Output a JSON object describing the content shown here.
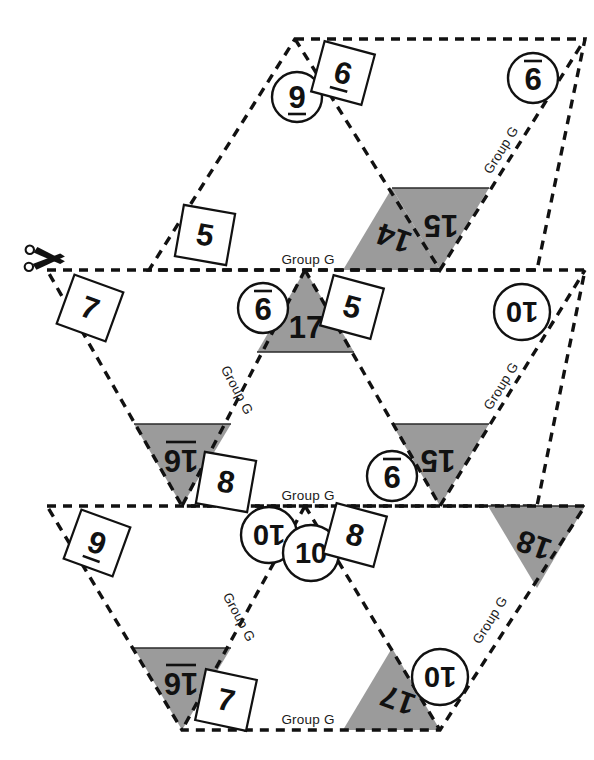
{
  "document": {
    "kind": "triangle-flash-card-cutout-sheet",
    "group_label": "Group G",
    "cut_icon": "scissors-icon",
    "colors": {
      "shade_fill": "#9b9b9b",
      "line": "#111111",
      "paper": "#ffffff"
    }
  },
  "group_labels": [
    {
      "id": "g-top-right",
      "text": "Group G"
    },
    {
      "id": "g-mid-top",
      "text": "Group G"
    },
    {
      "id": "g-mid-left",
      "text": "Group G"
    },
    {
      "id": "g-mid-right",
      "text": "Group G"
    },
    {
      "id": "g-bot-top",
      "text": "Group G"
    },
    {
      "id": "g-bot-left",
      "text": "Group G"
    },
    {
      "id": "g-bot-right",
      "text": "Group G"
    },
    {
      "id": "g-bot-bottom",
      "text": "Group G"
    }
  ],
  "cards": [
    {
      "id": "card-row1",
      "corner_numbers": [
        "9",
        "6",
        "9"
      ],
      "sum_numbers": [
        "15",
        "14"
      ]
    },
    {
      "id": "card-row2",
      "corner_numbers": [
        "7",
        "9",
        "5",
        "10",
        "9",
        "8"
      ],
      "sum_numbers": [
        "17",
        "16",
        "15"
      ]
    },
    {
      "id": "card-row3",
      "corner_numbers": [
        "9",
        "10",
        "10",
        "8",
        "10",
        "7"
      ],
      "sum_numbers": [
        "18",
        "16",
        "17"
      ]
    }
  ],
  "tokens": [
    {
      "id": "t-01",
      "value": "9",
      "shape": "circle",
      "underlined": true,
      "rotation": 0
    },
    {
      "id": "t-02",
      "value": "6",
      "shape": "square",
      "underlined": true,
      "rotation": 180
    },
    {
      "id": "t-03",
      "value": "9",
      "shape": "circle",
      "underlined": true,
      "rotation": 180
    },
    {
      "id": "t-04",
      "value": "15",
      "shape": "shaded",
      "underlined": false,
      "rotation": 180
    },
    {
      "id": "t-05",
      "value": "14",
      "shape": "shaded",
      "underlined": false,
      "rotation": 180
    },
    {
      "id": "t-06",
      "value": "5",
      "shape": "square",
      "underlined": false,
      "rotation": 180
    },
    {
      "id": "t-07",
      "value": "7",
      "shape": "square",
      "underlined": false,
      "rotation": 180
    },
    {
      "id": "t-08",
      "value": "9",
      "shape": "circle",
      "underlined": true,
      "rotation": 180
    },
    {
      "id": "t-09",
      "value": "17",
      "shape": "shaded",
      "underlined": false,
      "rotation": 0
    },
    {
      "id": "t-10",
      "value": "5",
      "shape": "square",
      "underlined": false,
      "rotation": 180
    },
    {
      "id": "t-11",
      "value": "10",
      "shape": "circle",
      "underlined": false,
      "rotation": 180
    },
    {
      "id": "t-12",
      "value": "16",
      "shape": "shaded",
      "underlined": true,
      "rotation": 180
    },
    {
      "id": "t-13",
      "value": "8",
      "shape": "square",
      "underlined": false,
      "rotation": 180
    },
    {
      "id": "t-14",
      "value": "9",
      "shape": "circle",
      "underlined": true,
      "rotation": 180
    },
    {
      "id": "t-15",
      "value": "15",
      "shape": "shaded",
      "underlined": false,
      "rotation": 180
    },
    {
      "id": "t-16",
      "value": "9",
      "shape": "square",
      "underlined": true,
      "rotation": 180
    },
    {
      "id": "t-17",
      "value": "10",
      "shape": "circle",
      "underlined": false,
      "rotation": 180
    },
    {
      "id": "t-18",
      "value": "10",
      "shape": "circle",
      "underlined": false,
      "rotation": 0
    },
    {
      "id": "t-19",
      "value": "8",
      "shape": "square",
      "underlined": false,
      "rotation": 180
    },
    {
      "id": "t-20",
      "value": "18",
      "shape": "shaded",
      "underlined": false,
      "rotation": 180
    },
    {
      "id": "t-21",
      "value": "16",
      "shape": "shaded",
      "underlined": true,
      "rotation": 180
    },
    {
      "id": "t-22",
      "value": "7",
      "shape": "square",
      "underlined": false,
      "rotation": 180
    },
    {
      "id": "t-23",
      "value": "17",
      "shape": "shaded",
      "underlined": false,
      "rotation": 180
    },
    {
      "id": "t-24",
      "value": "10",
      "shape": "circle",
      "underlined": false,
      "rotation": 180
    }
  ]
}
